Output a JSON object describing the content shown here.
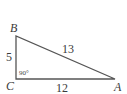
{
  "diagram": {
    "type": "right-triangle",
    "vertices": {
      "A": {
        "label": "A"
      },
      "B": {
        "label": "B"
      },
      "C": {
        "label": "C"
      }
    },
    "sides": {
      "BC": "5",
      "AB": "13",
      "CA": "12"
    },
    "right_angle_label": "90°",
    "line_color": "#555555"
  }
}
